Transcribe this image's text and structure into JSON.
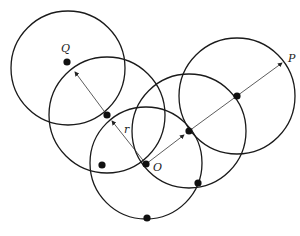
{
  "diagram": {
    "type": "overlapping circles (epsilon-neighborhood illustration)",
    "colors": {
      "stroke": "#1a1a1a",
      "point": "#111111",
      "background": "#ffffff"
    },
    "circles": [
      {
        "id": "c1",
        "cx": 68,
        "cy": 68,
        "r": 57
      },
      {
        "id": "c2",
        "cx": 107,
        "cy": 115,
        "r": 58
      },
      {
        "id": "c3",
        "cx": 146,
        "cy": 163,
        "r": 56
      },
      {
        "id": "c4",
        "cx": 189,
        "cy": 131,
        "r": 57
      },
      {
        "id": "c5",
        "cx": 237,
        "cy": 96,
        "r": 58
      }
    ],
    "points": [
      {
        "id": "Q",
        "x": 67,
        "y": 62
      },
      {
        "id": "p2",
        "x": 107,
        "y": 115
      },
      {
        "id": "p3",
        "x": 102,
        "y": 165
      },
      {
        "id": "O",
        "x": 146,
        "y": 164
      },
      {
        "id": "p5",
        "x": 189,
        "y": 131
      },
      {
        "id": "p6",
        "x": 237,
        "y": 96
      },
      {
        "id": "p7",
        "x": 198,
        "y": 183
      },
      {
        "id": "p8",
        "x": 147,
        "y": 218
      }
    ],
    "labels": {
      "Q": "Q",
      "P": "P",
      "O": "O",
      "r": "r"
    }
  }
}
